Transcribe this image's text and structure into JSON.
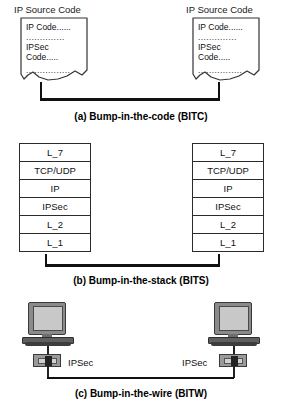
{
  "figure": {
    "panels": [
      {
        "id": "a",
        "caption": "(a) Bump-in-the-code (BITC)",
        "nodes": [
          {
            "header": "IP Source Code",
            "lines": [
              "IP Code......",
              "..............",
              "IPSec",
              "Code.....",
              "................"
            ]
          },
          {
            "header": "IP Source Code",
            "lines": [
              "IP Code......",
              "..............",
              "IPSec",
              "Code.....",
              "................"
            ]
          }
        ]
      },
      {
        "id": "b",
        "caption": "(b) Bump-in-the-stack (BITS)",
        "stacks": [
          {
            "layers": [
              "L_7",
              "TCP/UDP",
              "IP",
              "IPSec",
              "L_2",
              "L_1"
            ]
          },
          {
            "layers": [
              "L_7",
              "TCP/UDP",
              "IP",
              "IPSec",
              "L_2",
              "L_1"
            ]
          }
        ]
      },
      {
        "id": "c",
        "caption": "(c) Bump-in-the-wire (BITW)",
        "hosts": [
          {
            "device_label": "IPSec"
          },
          {
            "device_label": "IPSec"
          }
        ]
      }
    ]
  }
}
